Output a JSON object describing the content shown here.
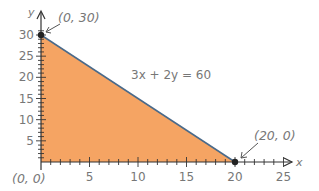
{
  "chart_data": {
    "type": "area",
    "title": "",
    "xlabel": "x",
    "ylabel": "y",
    "xlim": [
      0,
      26
    ],
    "ylim": [
      0,
      32
    ],
    "grid": false,
    "x_ticks": [
      5,
      10,
      15,
      20,
      25
    ],
    "y_ticks": [
      5,
      10,
      15,
      20,
      25,
      30
    ],
    "series": [
      {
        "name": "3x + 2y = 60",
        "type": "line",
        "points": [
          [
            0,
            30
          ],
          [
            20,
            0
          ]
        ]
      }
    ],
    "shaded_region": {
      "vertices": [
        [
          0,
          0
        ],
        [
          0,
          30
        ],
        [
          20,
          0
        ]
      ],
      "color": "#F5A463"
    },
    "annotations": [
      {
        "text": "(0, 30)",
        "point": [
          0,
          30
        ]
      },
      {
        "text": "(20, 0)",
        "point": [
          20,
          0
        ]
      },
      {
        "text": "(0, 0)",
        "point": [
          0,
          0
        ]
      },
      {
        "text": "3x + 2y = 60",
        "position": "above line"
      }
    ]
  },
  "labels": {
    "x_axis": "x",
    "y_axis": "y",
    "equation": "3x + 2y = 60",
    "point_a": "(0, 30)",
    "point_b": "(20, 0)",
    "origin": "(0, 0)",
    "x_ticks": [
      "5",
      "10",
      "15",
      "20",
      "25"
    ],
    "y_ticks": [
      "5",
      "10",
      "15",
      "20",
      "25",
      "30"
    ]
  },
  "colors": {
    "fill": "#F5A463",
    "line": "#4A6A8A",
    "axis": "#333333",
    "text": "#777777"
  }
}
